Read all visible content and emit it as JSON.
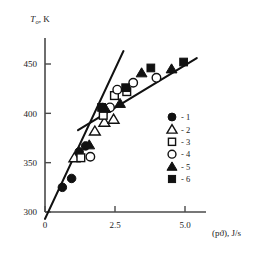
{
  "chart_data": {
    "type": "scatter",
    "title": "",
    "subtitle": "",
    "xlabel": "(pϑ), J/s",
    "ylabel": "T₀, K",
    "ylabel_main": "T",
    "ylabel_sub": "o",
    "ylabel_unit": ", K",
    "xlim": [
      0,
      5.5
    ],
    "ylim": [
      290,
      475
    ],
    "xticks": [
      0,
      2.5,
      5.0
    ],
    "xticklabels": [
      "0",
      "2.5",
      "5.0"
    ],
    "yticks": [
      300,
      350,
      400,
      450
    ],
    "yticklabels": [
      "300",
      "350",
      "400",
      "450"
    ],
    "grid": false,
    "legend_position": "center-right",
    "legend_entries": [
      {
        "label": "- 1",
        "marker": "filled-circle",
        "number": "1"
      },
      {
        "label": "- 2",
        "marker": "open-triangle",
        "number": "2"
      },
      {
        "label": "- 3",
        "marker": "open-square",
        "number": "3"
      },
      {
        "label": "- 4",
        "marker": "open-circle",
        "number": "4"
      },
      {
        "label": "- 5",
        "marker": "filled-triangle",
        "number": "5"
      },
      {
        "label": "- 6",
        "marker": "filled-square",
        "number": "6"
      }
    ],
    "series": [
      {
        "name": "1",
        "marker": "filled-circle",
        "points": [
          [
            0.62,
            325
          ],
          [
            0.95,
            334
          ],
          [
            1.22,
            361
          ],
          [
            1.45,
            367
          ],
          [
            2.05,
            406
          ]
        ]
      },
      {
        "name": "2",
        "marker": "open-triangle",
        "points": [
          [
            1.05,
            355
          ],
          [
            1.78,
            382
          ],
          [
            2.12,
            391
          ],
          [
            2.45,
            394
          ]
        ]
      },
      {
        "name": "3",
        "marker": "open-square",
        "points": [
          [
            1.28,
            355
          ],
          [
            2.08,
            398
          ],
          [
            2.48,
            418
          ],
          [
            2.92,
            422
          ]
        ]
      },
      {
        "name": "4",
        "marker": "open-circle",
        "points": [
          [
            1.62,
            356
          ],
          [
            2.32,
            406
          ],
          [
            2.58,
            424
          ],
          [
            3.15,
            431
          ],
          [
            3.98,
            436
          ]
        ]
      },
      {
        "name": "5",
        "marker": "filled-triangle",
        "points": [
          [
            1.58,
            368
          ],
          [
            2.15,
            405
          ],
          [
            2.68,
            410
          ],
          [
            3.45,
            441
          ],
          [
            4.52,
            445
          ]
        ]
      },
      {
        "name": "6",
        "marker": "filled-square",
        "points": [
          [
            2.02,
            406
          ],
          [
            2.88,
            426
          ],
          [
            3.78,
            446
          ],
          [
            4.95,
            452
          ]
        ]
      }
    ],
    "fit_lines": [
      {
        "name": "shallow-trend-line",
        "x": [
          1.18,
          5.42
        ],
        "y": [
          383,
          456
        ]
      },
      {
        "name": "steep-trend-line",
        "x": [
          0.0,
          2.8
        ],
        "y": [
          293,
          463
        ]
      }
    ]
  }
}
